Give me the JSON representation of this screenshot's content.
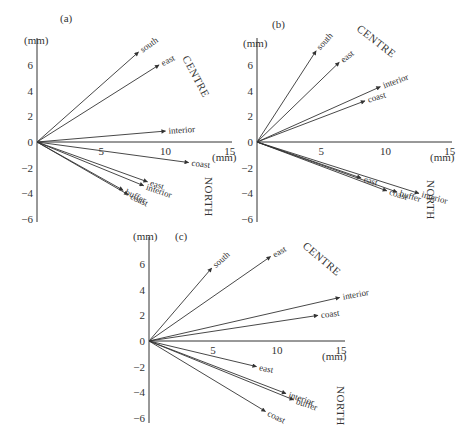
{
  "chart_data": [
    {
      "type": "vector",
      "panel_label": "(a)",
      "x_unit": "(mm)",
      "y_unit": "(mm)",
      "xlim": [
        0,
        15
      ],
      "ylim": [
        -6,
        7
      ],
      "x_ticks": [
        5,
        10,
        15
      ],
      "y_ticks": [
        6,
        4,
        2,
        0,
        -2,
        -4,
        -6
      ],
      "y_tick_labels": [
        "6",
        "4",
        "2",
        "0",
        "−2",
        "−4",
        "−6"
      ],
      "groups": [
        {
          "name": "CENTRE",
          "vectors": [
            {
              "label": "south",
              "x": 7.9,
              "y": 7.0
            },
            {
              "label": "east",
              "x": 9.5,
              "y": 6.0
            },
            {
              "label": "interior",
              "x": 10.0,
              "y": 0.85
            },
            {
              "label": "coast",
              "x": 11.8,
              "y": -1.6
            }
          ]
        },
        {
          "name": "NORTH",
          "vectors": [
            {
              "label": "east",
              "x": 8.6,
              "y": -3.1
            },
            {
              "label": "interior",
              "x": 8.3,
              "y": -3.4
            },
            {
              "label": "buffer",
              "x": 6.7,
              "y": -3.75
            },
            {
              "label": "coast",
              "x": 7.1,
              "y": -4.1
            }
          ]
        }
      ]
    },
    {
      "type": "vector",
      "panel_label": "(b)",
      "x_unit": "(mm)",
      "y_unit": "(mm)",
      "xlim": [
        0,
        15
      ],
      "ylim": [
        -6,
        7
      ],
      "x_ticks": [
        5,
        10,
        15
      ],
      "y_ticks": [
        6,
        4,
        2,
        0,
        -2,
        -4,
        -6
      ],
      "y_tick_labels": [
        "6",
        "4",
        "2",
        "0",
        "−2",
        "−4",
        "−6"
      ],
      "groups": [
        {
          "name": "CENTRE",
          "vectors": [
            {
              "label": "south",
              "x": 4.6,
              "y": 7.1
            },
            {
              "label": "east",
              "x": 6.4,
              "y": 6.2
            },
            {
              "label": "interior",
              "x": 9.6,
              "y": 4.3
            },
            {
              "label": "coast",
              "x": 8.4,
              "y": 3.2
            }
          ]
        },
        {
          "name": "NORTH",
          "vectors": [
            {
              "label": "east",
              "x": 8.1,
              "y": -2.8
            },
            {
              "label": "interior",
              "x": 12.6,
              "y": -4.0
            },
            {
              "label": "coast",
              "x": 10.1,
              "y": -3.8
            },
            {
              "label": "buffer",
              "x": 10.9,
              "y": -3.9
            }
          ]
        }
      ]
    },
    {
      "type": "vector",
      "panel_label": "(c)",
      "x_unit": "(mm)",
      "y_unit": "(mm)",
      "xlim": [
        0,
        15
      ],
      "ylim": [
        -6,
        7
      ],
      "x_ticks": [
        5,
        10,
        15
      ],
      "y_ticks": [
        6,
        4,
        2,
        0,
        -2,
        -4,
        -6
      ],
      "y_tick_labels": [
        "6",
        "4",
        "2",
        "0",
        "−2",
        "−4",
        "−6"
      ],
      "groups": [
        {
          "name": "CENTRE",
          "vectors": [
            {
              "label": "south",
              "x": 4.9,
              "y": 5.7
            },
            {
              "label": "east",
              "x": 9.5,
              "y": 6.6
            },
            {
              "label": "interior",
              "x": 14.9,
              "y": 3.4
            },
            {
              "label": "coast",
              "x": 13.2,
              "y": 2.0
            }
          ]
        },
        {
          "name": "NORTH",
          "vectors": [
            {
              "label": "east",
              "x": 8.4,
              "y": -2.0
            },
            {
              "label": "interior",
              "x": 10.7,
              "y": -4.1
            },
            {
              "label": "buffer",
              "x": 11.3,
              "y": -4.6
            },
            {
              "label": "coast",
              "x": 9.1,
              "y": -5.5
            }
          ]
        }
      ]
    }
  ]
}
